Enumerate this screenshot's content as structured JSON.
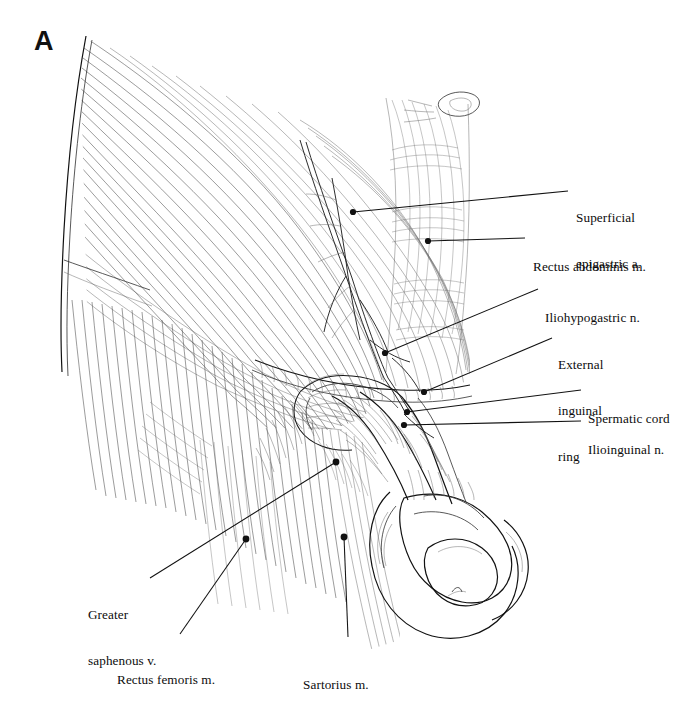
{
  "figure": {
    "panel_letter": "A",
    "caption_region": "Anterior abdominal wall and inguinal region dissection, male",
    "background_color": "#ffffff",
    "ink_color": "#111111",
    "width": 695,
    "height": 703
  },
  "labels": [
    {
      "id": "superficial-epigastric-a",
      "text": "Superficial\nepigastric a.",
      "lines": [
        "Superficial",
        "epigastric a."
      ],
      "side": "right",
      "text_x": 576,
      "text_y": 179,
      "leader": {
        "x1": 568,
        "y1": 191,
        "x2": 353,
        "y2": 212,
        "dot": true,
        "dot_x": 353,
        "dot_y": 212
      }
    },
    {
      "id": "rectus-abdominis-m",
      "text": "Rectus abdominis m.",
      "lines": [
        "Rectus abdominis m."
      ],
      "side": "right",
      "text_x": 533,
      "text_y": 228,
      "leader": {
        "x1": 525,
        "y1": 238,
        "x2": 428,
        "y2": 241,
        "dot": true,
        "dot_x": 428,
        "dot_y": 241
      }
    },
    {
      "id": "iliohypogastric-n",
      "text": "Iliohypogastric n.",
      "lines": [
        "Iliohypogastric n."
      ],
      "side": "right",
      "text_x": 545,
      "text_y": 279,
      "leader": {
        "x1": 538,
        "y1": 289,
        "x2": 385,
        "y2": 353,
        "dot": true,
        "dot_x": 385,
        "dot_y": 353
      }
    },
    {
      "id": "external-inguinal-ring",
      "text": "External\ninguinal\nring",
      "lines": [
        "External",
        "inguinal",
        "ring"
      ],
      "side": "right",
      "text_x": 558,
      "text_y": 326,
      "leader": {
        "x1": 552,
        "y1": 338,
        "x2": 424,
        "y2": 392,
        "dot": true,
        "dot_x": 424,
        "dot_y": 392
      }
    },
    {
      "id": "spermatic-cord",
      "text": "Spermatic cord",
      "lines": [
        "Spermatic cord"
      ],
      "side": "right",
      "text_x": 588,
      "text_y": 380,
      "leader": {
        "x1": 581,
        "y1": 390,
        "x2": 407,
        "y2": 412,
        "dot": true,
        "dot_x": 407,
        "dot_y": 412
      }
    },
    {
      "id": "ilioinguinal-n",
      "text": "Ilioinguinal n.",
      "lines": [
        "Ilioinguinal n."
      ],
      "side": "right",
      "text_x": 588,
      "text_y": 411,
      "leader": {
        "x1": 581,
        "y1": 421,
        "x2": 404,
        "y2": 425,
        "dot": true,
        "dot_x": 404,
        "dot_y": 425
      }
    },
    {
      "id": "greater-saphenous-v",
      "text": "Greater\nsaphenous v.",
      "lines": [
        "Greater",
        "saphenous v."
      ],
      "side": "left",
      "text_x": 88,
      "text_y": 576,
      "leader": {
        "x1": 150,
        "y1": 578,
        "x2": 336,
        "y2": 462,
        "dot": true,
        "dot_x": 336,
        "dot_y": 462
      }
    },
    {
      "id": "rectus-femoris-m",
      "text": "Rectus femoris m.",
      "lines": [
        "Rectus femoris m."
      ],
      "side": "left",
      "text_x": 117,
      "text_y": 641,
      "leader": {
        "x1": 180,
        "y1": 634,
        "x2": 246,
        "y2": 539,
        "dot": true,
        "dot_x": 246,
        "dot_y": 539
      }
    },
    {
      "id": "sartorius-m",
      "text": "Sartorius m.",
      "lines": [
        "Sartorius m."
      ],
      "side": "left",
      "text_x": 303,
      "text_y": 646,
      "leader": {
        "x1": 348,
        "y1": 637,
        "x2": 344,
        "y2": 537,
        "dot": true,
        "dot_x": 344,
        "dot_y": 537
      }
    }
  ],
  "structures": [
    "external oblique aponeurosis",
    "rectus abdominis sheath",
    "inguinal ligament",
    "external inguinal ring",
    "spermatic cord",
    "ilioinguinal nerve",
    "iliohypogastric nerve",
    "superficial epigastric artery",
    "greater saphenous vein",
    "sartorius muscle",
    "rectus femoris muscle",
    "scrotum and penis"
  ]
}
